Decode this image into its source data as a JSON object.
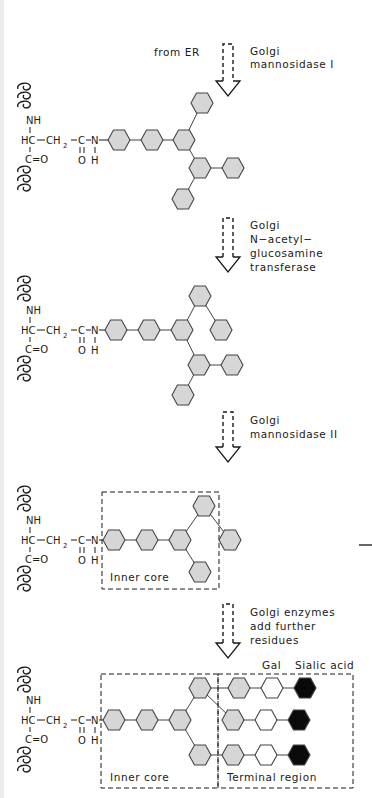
{
  "colors": {
    "line": "#444444",
    "hex_gray": "#d6d6d6",
    "hex_white": "#ffffff",
    "hex_black": "#0a0a0a",
    "ink": "#1a1a1a",
    "strip": "#ececec"
  },
  "panels": [
    {
      "id": "panel-1",
      "arrow": {
        "x": 228,
        "y_top": 44,
        "y_tip": 96
      },
      "labels": [
        {
          "text": "from ER",
          "x": 154,
          "y": 56
        },
        {
          "text": "Golgi",
          "x": 250,
          "y": 55
        },
        {
          "text": "mannosidase I",
          "x": 250,
          "y": 68
        }
      ],
      "anchor_y": 140,
      "asn": {
        "helix_top_y": 82,
        "helix_bottom_y": 165
      },
      "hexes": [
        {
          "x": 119,
          "y": 140,
          "fill": "gray"
        },
        {
          "x": 152,
          "y": 140,
          "fill": "gray"
        },
        {
          "x": 184,
          "y": 140,
          "fill": "gray"
        },
        {
          "x": 202,
          "y": 103,
          "fill": "gray"
        },
        {
          "x": 200,
          "y": 168,
          "fill": "gray"
        },
        {
          "x": 233,
          "y": 168,
          "fill": "gray"
        },
        {
          "x": 183,
          "y": 199,
          "fill": "gray"
        }
      ],
      "bonds": [
        [
          0,
          1
        ],
        [
          1,
          2
        ],
        [
          2,
          3
        ],
        [
          2,
          4
        ],
        [
          4,
          5
        ],
        [
          4,
          6
        ]
      ],
      "boxes": []
    },
    {
      "id": "panel-2",
      "arrow": {
        "x": 228,
        "y_top": 218,
        "y_tip": 272
      },
      "labels": [
        {
          "text": "Golgi",
          "x": 250,
          "y": 229
        },
        {
          "text": "N−acetyl−",
          "x": 250,
          "y": 243
        },
        {
          "text": "glucosamine",
          "x": 250,
          "y": 257
        },
        {
          "text": "transferase",
          "x": 250,
          "y": 271
        }
      ],
      "anchor_y": 330,
      "asn": {
        "helix_top_y": 275,
        "helix_bottom_y": 355
      },
      "hexes": [
        {
          "x": 116,
          "y": 330,
          "fill": "gray"
        },
        {
          "x": 149,
          "y": 330,
          "fill": "gray"
        },
        {
          "x": 182,
          "y": 330,
          "fill": "gray"
        },
        {
          "x": 200,
          "y": 296,
          "fill": "gray"
        },
        {
          "x": 221,
          "y": 330,
          "fill": "gray"
        },
        {
          "x": 199,
          "y": 365,
          "fill": "gray"
        },
        {
          "x": 232,
          "y": 365,
          "fill": "gray"
        },
        {
          "x": 183,
          "y": 395,
          "fill": "gray"
        }
      ],
      "bonds": [
        [
          0,
          1
        ],
        [
          1,
          2
        ],
        [
          2,
          3
        ],
        [
          3,
          4
        ],
        [
          2,
          5
        ],
        [
          5,
          6
        ],
        [
          5,
          7
        ]
      ],
      "boxes": []
    },
    {
      "id": "panel-3",
      "arrow": {
        "x": 228,
        "y_top": 412,
        "y_tip": 462
      },
      "labels": [
        {
          "text": "Golgi",
          "x": 250,
          "y": 424
        },
        {
          "text": "mannosidase II",
          "x": 250,
          "y": 438
        }
      ],
      "anchor_y": 540,
      "asn": {
        "helix_top_y": 485,
        "helix_bottom_y": 565
      },
      "hexes": [
        {
          "x": 114,
          "y": 540,
          "fill": "gray"
        },
        {
          "x": 147,
          "y": 540,
          "fill": "gray"
        },
        {
          "x": 180,
          "y": 540,
          "fill": "gray"
        },
        {
          "x": 204,
          "y": 506,
          "fill": "gray"
        },
        {
          "x": 230,
          "y": 540,
          "fill": "gray"
        },
        {
          "x": 200,
          "y": 572,
          "fill": "gray"
        }
      ],
      "bonds": [
        [
          0,
          1
        ],
        [
          1,
          2
        ],
        [
          2,
          3
        ],
        [
          3,
          4
        ],
        [
          2,
          5
        ]
      ],
      "boxes": [
        {
          "x": 102,
          "y": 492,
          "w": 117,
          "h": 97,
          "label": "Inner core",
          "label_x": 110,
          "label_y": 581
        }
      ]
    },
    {
      "id": "panel-4",
      "arrow": {
        "x": 228,
        "y_top": 604,
        "y_tip": 658
      },
      "labels": [
        {
          "text": "Golgi enzymes",
          "x": 250,
          "y": 616
        },
        {
          "text": "add further",
          "x": 250,
          "y": 630
        },
        {
          "text": "residues",
          "x": 250,
          "y": 644
        },
        {
          "text": "Gal",
          "x": 262,
          "y": 669
        },
        {
          "text": "Sialic acid",
          "x": 295,
          "y": 669
        }
      ],
      "anchor_y": 720,
      "asn": {
        "helix_top_y": 666,
        "helix_bottom_y": 746
      },
      "hexes": [
        {
          "x": 114,
          "y": 720,
          "fill": "gray"
        },
        {
          "x": 147,
          "y": 720,
          "fill": "gray"
        },
        {
          "x": 180,
          "y": 720,
          "fill": "gray"
        },
        {
          "x": 200,
          "y": 688,
          "fill": "gray"
        },
        {
          "x": 200,
          "y": 755,
          "fill": "gray"
        },
        {
          "x": 239,
          "y": 688,
          "fill": "gray"
        },
        {
          "x": 272,
          "y": 688,
          "fill": "white"
        },
        {
          "x": 305,
          "y": 688,
          "fill": "black"
        },
        {
          "x": 233,
          "y": 720,
          "fill": "gray"
        },
        {
          "x": 266,
          "y": 720,
          "fill": "white"
        },
        {
          "x": 299,
          "y": 720,
          "fill": "black"
        },
        {
          "x": 233,
          "y": 755,
          "fill": "gray"
        },
        {
          "x": 266,
          "y": 755,
          "fill": "white"
        },
        {
          "x": 299,
          "y": 755,
          "fill": "black"
        }
      ],
      "bonds": [
        [
          0,
          1
        ],
        [
          1,
          2
        ],
        [
          2,
          3
        ],
        [
          2,
          4
        ],
        [
          3,
          5
        ],
        [
          5,
          6
        ],
        [
          6,
          7
        ],
        [
          3,
          8
        ],
        [
          8,
          9
        ],
        [
          9,
          10
        ],
        [
          4,
          11
        ],
        [
          11,
          12
        ],
        [
          12,
          13
        ]
      ],
      "boxes": [
        {
          "x": 101,
          "y": 674,
          "w": 117,
          "h": 114,
          "label": "Inner core",
          "label_x": 110,
          "label_y": 781
        },
        {
          "x": 218,
          "y": 674,
          "w": 135,
          "h": 114,
          "label": "Terminal region",
          "label_x": 227,
          "label_y": 781
        }
      ]
    }
  ],
  "chemistry": {
    "nh": "NH",
    "hc": "HC",
    "ch": "CH",
    "ch_sub": "2",
    "co_left": "C=O",
    "amide_c": "C",
    "amide_n": "N",
    "amide_o": "O",
    "amide_h": "H"
  },
  "stray_mark": {
    "x1": 359,
    "y1": 545,
    "x2": 372,
    "y2": 545
  }
}
